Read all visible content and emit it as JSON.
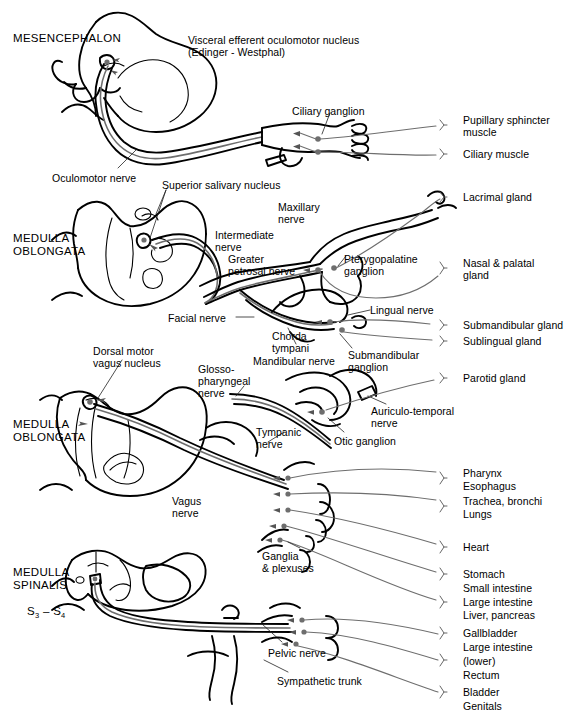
{
  "figure": {
    "colors": {
      "outline": "#000000",
      "nerve_line": "#6e6e6e",
      "leader_line": "#777777",
      "background": "#ffffff",
      "text": "#000000"
    }
  },
  "regions": [
    {
      "id": "mesencephalon",
      "label": "MESENCEPHALON",
      "x": 13,
      "y": 32
    },
    {
      "id": "medulla-oblongata-1",
      "label": "MEDULLA\nOBLONGATA",
      "x": 13,
      "y": 232
    },
    {
      "id": "medulla-oblongata-2",
      "label": "MEDULLA\nOBLONGATA",
      "x": 13,
      "y": 418
    },
    {
      "id": "medulla-spinalis",
      "label": "MEDULLA\nSPINALIS",
      "segments": "S3 – S4",
      "x": 13,
      "y": 566
    }
  ],
  "structure_labels": [
    {
      "id": "visceral-efferent-oculomotor-nucleus",
      "label": "Visceral efferent oculomotor nucleus\n(Edinger - Westphal)",
      "x": 188,
      "y": 35
    },
    {
      "id": "ciliary-ganglion",
      "label": "Ciliary ganglion",
      "x": 292,
      "y": 106
    },
    {
      "id": "oculomotor-nerve",
      "label": "Oculomotor nerve",
      "x": 52,
      "y": 173
    },
    {
      "id": "superior-salivary-nucleus",
      "label": "Superior salivary nucleus",
      "x": 162,
      "y": 180
    },
    {
      "id": "maxillary-nerve",
      "label": "Maxillary\nnerve",
      "x": 278,
      "y": 202
    },
    {
      "id": "intermediate-nerve",
      "label": "Intermediate\nnerve",
      "x": 215,
      "y": 230
    },
    {
      "id": "greater-petrosal-nerve",
      "label": "Greater\npetrosal nerve",
      "x": 228,
      "y": 254
    },
    {
      "id": "pterygopalatine-ganglion",
      "label": "Pterygopalatine\nganglion",
      "x": 344,
      "y": 254
    },
    {
      "id": "lingual-nerve",
      "label": "Lingual nerve",
      "x": 370,
      "y": 305
    },
    {
      "id": "facial-nerve",
      "label": "Facial nerve",
      "x": 168,
      "y": 313
    },
    {
      "id": "chorda-tympani",
      "label": "Chorda\ntympani",
      "x": 272,
      "y": 331
    },
    {
      "id": "submandibular-ganglion",
      "label": "Submandibular\nganglion",
      "x": 348,
      "y": 350
    },
    {
      "id": "mandibular-nerve",
      "label": "Mandibular nerve",
      "x": 253,
      "y": 356
    },
    {
      "id": "dorsal-motor-vagus-nucleus",
      "label": "Dorsal motor\nvagus nucleus",
      "x": 93,
      "y": 346
    },
    {
      "id": "glossopharyngeal-nerve",
      "label": "Glosso-\npharyngeal\nnerve",
      "x": 198,
      "y": 364
    },
    {
      "id": "auriculo-temporal-nerve",
      "label": "Auriculo-temporal\nnerve",
      "x": 371,
      "y": 406
    },
    {
      "id": "tympanic-nerve",
      "label": "Tympanic\nnerve",
      "x": 256,
      "y": 427
    },
    {
      "id": "otic-ganglion",
      "label": "Otic ganglion",
      "x": 334,
      "y": 436
    },
    {
      "id": "vagus-nerve",
      "label": "Vagus\nnerve",
      "x": 172,
      "y": 496
    },
    {
      "id": "ganglia-and-plexuses",
      "label": "Ganglia\n& plexuses",
      "x": 262,
      "y": 551
    },
    {
      "id": "pelvic-nerve",
      "label": "Pelvic nerve",
      "x": 268,
      "y": 648
    },
    {
      "id": "sympathetic-trunk",
      "label": "Sympathetic trunk",
      "x": 277,
      "y": 676
    }
  ],
  "target_organs": [
    {
      "id": "pupillary-sphincter-muscle",
      "label": "Pupillary sphincter\nmuscle",
      "x": 463,
      "y": 115,
      "bracket_y": 126
    },
    {
      "id": "ciliary-muscle",
      "label": "Ciliary muscle",
      "x": 463,
      "y": 149,
      "bracket_y": 154
    },
    {
      "id": "lacrimal-gland",
      "label": "Lacrimal gland",
      "x": 463,
      "y": 192,
      "bracket_y": 197
    },
    {
      "id": "nasal-and-palatal-gland",
      "label": "Nasal & palatal\ngland",
      "x": 463,
      "y": 258,
      "bracket_y": 269
    },
    {
      "id": "submandibular-gland",
      "label": "Submandibular gland",
      "x": 463,
      "y": 320,
      "bracket_y": 325
    },
    {
      "id": "sublingual-gland",
      "label": "Sublingual gland",
      "x": 463,
      "y": 336,
      "bracket_y": 341
    },
    {
      "id": "parotid-gland",
      "label": "Parotid gland",
      "x": 463,
      "y": 373,
      "bracket_y": 378
    },
    {
      "id": "pharynx",
      "label": "Pharynx",
      "x": 463,
      "y": 468,
      "bracket_y": 479
    },
    {
      "id": "esophagus",
      "label": "Esophagus",
      "x": 463,
      "y": 481,
      "bracket_y": -1
    },
    {
      "id": "trachea-bronchi",
      "label": "Trachea, bronchi",
      "x": 463,
      "y": 496,
      "bracket_y": 507
    },
    {
      "id": "lungs",
      "label": "Lungs",
      "x": 463,
      "y": 509,
      "bracket_y": -1
    },
    {
      "id": "heart",
      "label": "Heart",
      "x": 463,
      "y": 542,
      "bracket_y": 547
    },
    {
      "id": "stomach",
      "label": "Stomach",
      "x": 463,
      "y": 569,
      "bracket_y": 574
    },
    {
      "id": "small-intestine",
      "label": "Small intestine",
      "x": 463,
      "y": 583,
      "bracket_y": -1
    },
    {
      "id": "large-intestine",
      "label": "Large intestine",
      "x": 463,
      "y": 597,
      "bracket_y": 603
    },
    {
      "id": "liver-pancreas",
      "label": "Liver, pancreas",
      "x": 463,
      "y": 610,
      "bracket_y": -1
    },
    {
      "id": "gallbladder",
      "label": "Gallbladder",
      "x": 463,
      "y": 628,
      "bracket_y": 633
    },
    {
      "id": "large-intestine-lower-a",
      "label": "Large intestine",
      "x": 463,
      "y": 642,
      "bracket_y": -1
    },
    {
      "id": "large-intestine-lower-b",
      "label": "(lower)",
      "x": 463,
      "y": 656,
      "bracket_y": 661
    },
    {
      "id": "rectum",
      "label": "Rectum",
      "x": 463,
      "y": 670,
      "bracket_y": -1
    },
    {
      "id": "bladder",
      "label": "Bladder",
      "x": 463,
      "y": 687,
      "bracket_y": 692
    },
    {
      "id": "genitals",
      "label": "Genitals",
      "x": 463,
      "y": 701,
      "bracket_y": -1
    }
  ]
}
